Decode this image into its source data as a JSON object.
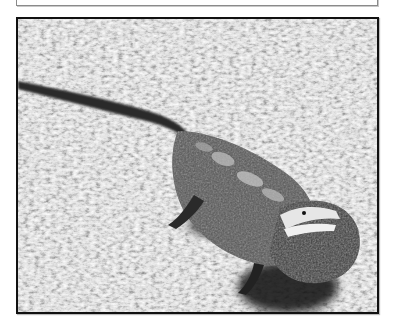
{
  "caption_box": {
    "text": "",
    "note": "cropped text line, only descenders visible"
  },
  "figure": {
    "style": "grayscale photograph",
    "colors": {
      "frame_border": "#111111",
      "grass_light": "#e8e8e8",
      "grass_mid": "#9a9a9a",
      "grass_dark": "#3a3a3a",
      "lizard_body": "#4a4a4a",
      "lizard_dark": "#1a1a1a",
      "shadow": "#0a0a0a"
    }
  }
}
